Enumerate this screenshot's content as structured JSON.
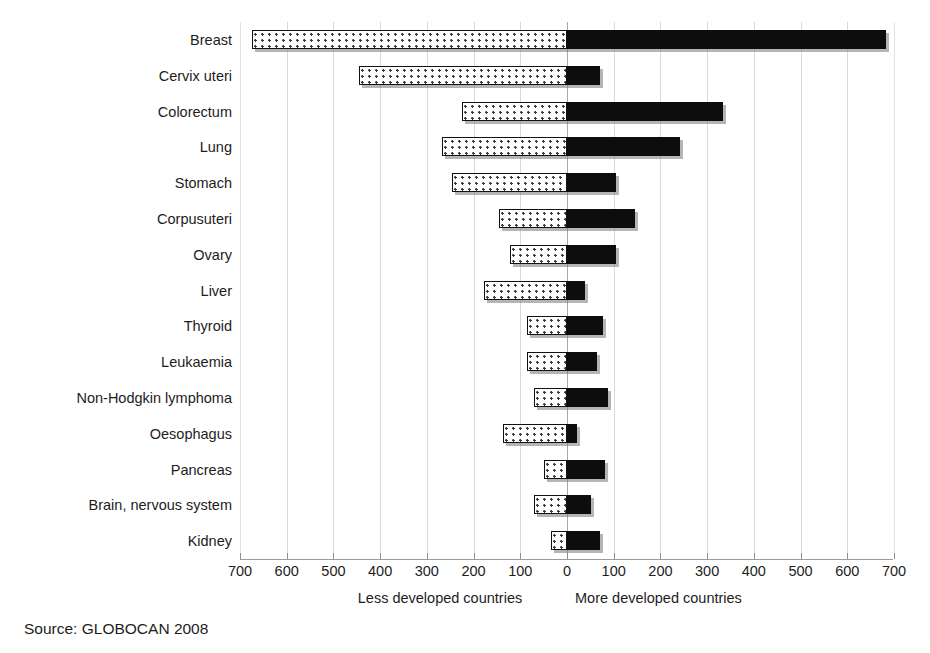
{
  "chart_data": {
    "type": "bar",
    "orientation": "horizontal",
    "style": "diverging-bidirectional",
    "title": "",
    "subtitle": "",
    "xlabel": "",
    "ylabel": "",
    "source_note": "Source: GLOBOCAN 2008",
    "axis": {
      "left_caption": "Less developed countries",
      "right_caption": "More developed countries",
      "tick_step": 100,
      "left_max": 700,
      "right_max": 700,
      "tick_labels": [
        "700",
        "600",
        "500",
        "400",
        "300",
        "200",
        "100",
        "0",
        "100",
        "200",
        "300",
        "400",
        "500",
        "600",
        "700"
      ],
      "tick_values": [
        -700,
        -600,
        -500,
        -400,
        -300,
        -200,
        -100,
        0,
        100,
        200,
        300,
        400,
        500,
        600,
        700
      ],
      "xlim": [
        -700,
        700
      ],
      "grid": true,
      "grid_orientation": "vertical",
      "legend": "none"
    },
    "categories": [
      "Breast",
      "Cervix uteri",
      "Colorectum",
      "Lung",
      "Stomach",
      "Corpusuteri",
      "Ovary",
      "Liver",
      "Thyroid",
      "Leukaemia",
      "Non-Hodgkin lymphoma",
      "Oesophagus",
      "Pancreas",
      "Brain, nervous system",
      "Kidney"
    ],
    "series": [
      {
        "name": "Less developed countries",
        "side": "left",
        "fill": "dotted-white",
        "color": "#ffffff",
        "values": [
          675,
          445,
          225,
          267,
          246,
          145,
          123,
          178,
          85,
          86,
          70,
          138,
          50,
          70,
          35
        ]
      },
      {
        "name": "More developed countries",
        "side": "right",
        "fill": "solid-black",
        "color": "#0d0d0d",
        "values": [
          683,
          71,
          333,
          242,
          104,
          146,
          104,
          38,
          77,
          64,
          88,
          22,
          82,
          51,
          71
        ]
      }
    ]
  }
}
